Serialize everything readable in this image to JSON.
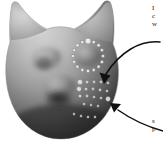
{
  "figure": {
    "background_color": "#ffffff",
    "width": 163,
    "height": 145
  },
  "surface": {
    "name": "cat-head-mesh",
    "shading": "grayscale-matte",
    "highlight_color": "#cfcfcf",
    "midtone_color": "#8e8e8e",
    "shadow_color": "#2e2e2e",
    "outline_color": "#9a9a9a",
    "features": [
      {
        "name": "left-ear",
        "kind": "pointed-ear"
      },
      {
        "name": "right-ear",
        "kind": "pointed-ear"
      },
      {
        "name": "left-eye-bump",
        "kind": "convex-bump"
      },
      {
        "name": "right-eye-bump",
        "kind": "convex-bump"
      },
      {
        "name": "muzzle-bump",
        "kind": "convex-bump"
      },
      {
        "name": "mouth-crease",
        "kind": "concave-crease"
      }
    ]
  },
  "annotations": {
    "marker_color": "#f2f2f2",
    "marker_edge_color": "#6a6a6a",
    "ring_cluster": {
      "name": "ring-marker-cluster",
      "label": "circular ring of sample points",
      "point_count": 16,
      "center": [
        88,
        56
      ],
      "radius": 15
    },
    "grid_cluster": {
      "name": "grid-marker-cluster",
      "label": "grid of sample points",
      "point_count": 22,
      "origin": [
        80,
        82
      ],
      "spacing": 7
    },
    "arrows": [
      {
        "name": "arrow-to-ring-cluster",
        "direction": "down-left",
        "from": [
          152,
          44
        ],
        "to": [
          101,
          84
        ],
        "color": "#111111"
      },
      {
        "name": "arrow-to-grid-cluster",
        "direction": "up-left",
        "from": [
          160,
          128
        ],
        "to": [
          111,
          105
        ],
        "color": "#111111"
      }
    ]
  },
  "captions": {
    "top": {
      "name": "caption-top",
      "lines": [
        "I",
        "c",
        "w"
      ],
      "note": "text truncated at right image edge"
    },
    "bottom": {
      "name": "caption-bottom",
      "lines": [
        "s",
        "p"
      ],
      "note": "text truncated at right image edge"
    }
  }
}
